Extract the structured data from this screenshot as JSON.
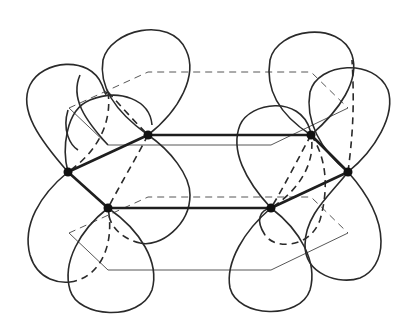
{
  "diagram": {
    "title": "",
    "colors": {
      "stroke": "#2a2a2a",
      "atom": "#111111",
      "background": "#ffffff"
    },
    "atoms": [
      {
        "id": "C1",
        "x": 68,
        "y": 172
      },
      {
        "id": "C2",
        "x": 148,
        "y": 135
      },
      {
        "id": "C3",
        "x": 311,
        "y": 135
      },
      {
        "id": "C4",
        "x": 348,
        "y": 172
      },
      {
        "id": "C5",
        "x": 271,
        "y": 208
      },
      {
        "id": "C6",
        "x": 108,
        "y": 208
      }
    ],
    "bonds": [
      [
        "C1",
        "C2"
      ],
      [
        "C2",
        "C3"
      ],
      [
        "C3",
        "C4"
      ],
      [
        "C4",
        "C5"
      ],
      [
        "C5",
        "C6"
      ],
      [
        "C6",
        "C1"
      ]
    ],
    "labels": []
  }
}
